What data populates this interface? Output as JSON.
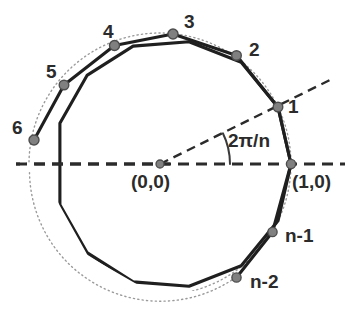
{
  "figure": {
    "background_color": "#ffffff",
    "text_color": "#2b2b2b",
    "circle_color": "#9a9a9a",
    "polygon_color": "#1f1f1f",
    "dashed_color": "#2b2b2b",
    "vertex_fill": "#808080",
    "vertex_stroke": "#4d4d4d"
  },
  "geometry": {
    "center_px": [
      160,
      164
    ],
    "radius_px": 131,
    "n_sides": 14,
    "step_degrees": 25.714,
    "circle_style": "dotted",
    "polygon_style": "solid",
    "axis_style": "dashed",
    "ray_style": "dashed",
    "arc_style": "solid"
  },
  "vertex_labels": [
    {
      "name": "vertex-1",
      "text": "1",
      "x": 288,
      "y": 97
    },
    {
      "name": "vertex-2",
      "text": "2",
      "x": 249,
      "y": 40
    },
    {
      "name": "vertex-3",
      "text": "3",
      "x": 184,
      "y": 12
    },
    {
      "name": "vertex-4",
      "text": "4",
      "x": 103,
      "y": 22
    },
    {
      "name": "vertex-5",
      "text": "5",
      "x": 46,
      "y": 62
    },
    {
      "name": "vertex-6",
      "text": "6",
      "x": 12,
      "y": 118
    },
    {
      "name": "vertex-n-1",
      "text": "n-1",
      "x": 285,
      "y": 226
    },
    {
      "name": "vertex-n-2",
      "text": "n-2",
      "x": 250,
      "y": 272
    }
  ],
  "coordinate_labels": [
    {
      "name": "origin-label",
      "text": "(0,0)",
      "x": 131,
      "y": 172
    },
    {
      "name": "unit-point-label",
      "text": "(1,0)",
      "x": 292,
      "y": 172
    }
  ],
  "angle_label": {
    "name": "central-angle-label",
    "text": "2π/n",
    "x": 228,
    "y": 131
  },
  "points": {
    "origin": {
      "label": "(0,0)",
      "x": 160,
      "y": 164
    },
    "unit": {
      "label": "(1,0)",
      "x": 291,
      "y": 164
    }
  }
}
